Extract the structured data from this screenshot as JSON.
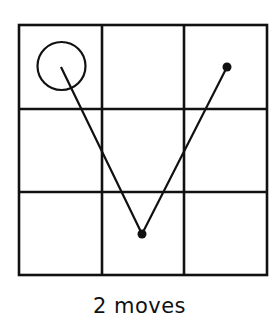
{
  "diagram": {
    "grid": {
      "rows": 3,
      "cols": 3
    },
    "start": {
      "row": 0,
      "col": 0,
      "marker": "open-circle"
    },
    "path": [
      {
        "row": 0,
        "col": 0
      },
      {
        "row": 2,
        "col": 1
      },
      {
        "row": 0,
        "col": 2
      }
    ],
    "caption": "2 moves",
    "colors": {
      "ink": "#111111",
      "background": "#ffffff"
    }
  }
}
